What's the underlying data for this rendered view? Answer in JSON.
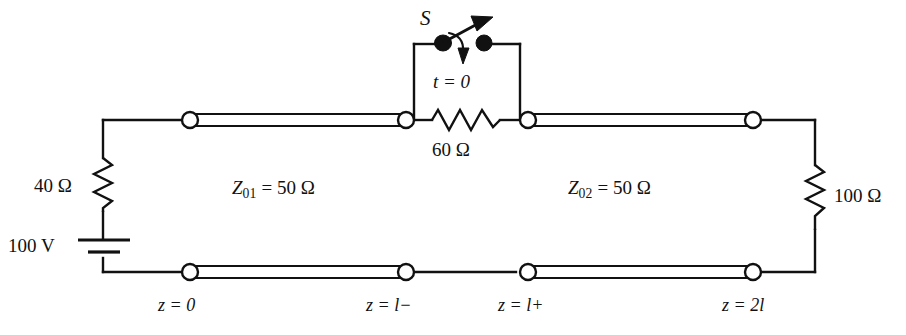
{
  "figure": {
    "type": "circuit-schematic"
  },
  "source": {
    "series_resistor_label": "40 Ω",
    "series_resistor_value": 40,
    "series_resistor_unit": "Ω",
    "voltage_label": "100 V",
    "voltage_value": 100,
    "voltage_unit": "V"
  },
  "junction": {
    "switch_label": "S",
    "switch_time_label": "t = 0",
    "resistor_label": "60 Ω",
    "resistor_value": 60,
    "resistor_unit": "Ω"
  },
  "load": {
    "label": "100 Ω",
    "value": 100,
    "unit": "Ω"
  },
  "lines": [
    {
      "name": "line-1",
      "symbol": "Z",
      "subscript": "01",
      "equals": "=",
      "value": "50 Ω",
      "full_label": "Z01 = 50 Ω"
    },
    {
      "name": "line-2",
      "symbol": "Z",
      "subscript": "02",
      "equals": "=",
      "value": "50 Ω",
      "full_label": "Z02 = 50 Ω"
    }
  ],
  "z_axis_labels": [
    {
      "name": "z-start",
      "text": "z = 0"
    },
    {
      "name": "z-l-minus",
      "text": "z = l−"
    },
    {
      "name": "z-l-plus",
      "text": "z = l+"
    },
    {
      "name": "z-2l",
      "text": "z = 2l"
    }
  ],
  "colors": {
    "ink": "#111111",
    "background": "#ffffff",
    "terminal_fill": "#ffffff",
    "switch_dot": "#111111"
  }
}
